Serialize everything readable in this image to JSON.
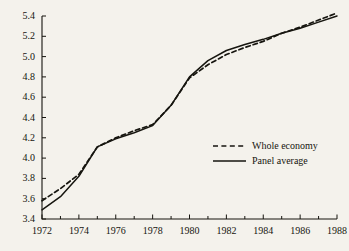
{
  "chart_data": {
    "type": "line",
    "title": "",
    "subtitle": "",
    "xlabel": "",
    "ylabel": "",
    "xlim": [
      1972,
      1988
    ],
    "ylim": [
      3.4,
      5.4
    ],
    "grid": false,
    "legend_position": "inside-right",
    "x_ticks": [
      1972,
      1974,
      1976,
      1978,
      1980,
      1982,
      1984,
      1986,
      1988
    ],
    "x_tick_labels": [
      "1972",
      "1974",
      "1976",
      "1978",
      "1980",
      "1982",
      "1984",
      "1986",
      "1988"
    ],
    "x_minor_ticks": [
      1973,
      1975,
      1977,
      1979,
      1981,
      1983,
      1985,
      1987
    ],
    "y_ticks": [
      3.4,
      3.6,
      3.8,
      4.0,
      4.2,
      4.4,
      4.6,
      4.8,
      5.0,
      5.2,
      5.4
    ],
    "y_tick_labels": [
      "3.4",
      "3.6",
      "3.8",
      "4.0",
      "4.2",
      "4.4",
      "4.6",
      "4.8",
      "5.0",
      "5.2",
      "5.4"
    ],
    "x": [
      1972,
      1973,
      1974,
      1975,
      1976,
      1977,
      1978,
      1979,
      1980,
      1981,
      1982,
      1983,
      1984,
      1985,
      1986,
      1987,
      1988
    ],
    "series": [
      {
        "name": "Whole economy",
        "style": "dashed",
        "color": "#16150f",
        "values": [
          3.58,
          3.7,
          3.84,
          4.11,
          4.2,
          4.27,
          4.33,
          4.52,
          4.79,
          4.92,
          5.02,
          5.09,
          5.15,
          5.23,
          5.29,
          5.36,
          5.43
        ]
      },
      {
        "name": "Panel average",
        "style": "solid",
        "color": "#16150f",
        "values": [
          3.49,
          3.62,
          3.82,
          4.11,
          4.19,
          4.25,
          4.32,
          4.52,
          4.8,
          4.96,
          5.06,
          5.12,
          5.17,
          5.23,
          5.28,
          5.34,
          5.4
        ]
      }
    ]
  },
  "legend": {
    "items": [
      {
        "label": "Whole economy",
        "style": "dashed"
      },
      {
        "label": "Panel average",
        "style": "solid"
      }
    ]
  },
  "colors": {
    "background": "#f4f2ec",
    "ink": "#16150f"
  }
}
